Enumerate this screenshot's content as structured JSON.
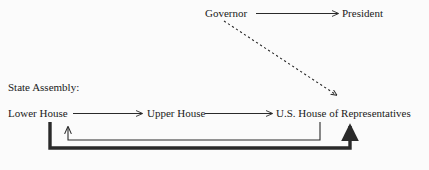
{
  "diagram": {
    "background_color": "#fbfbfb",
    "line_color": "#2a2a2a",
    "text_color": "#1a1a1a",
    "nodes": {
      "governor": "Governor",
      "president": "President",
      "state_assembly": "State Assembly:",
      "lower_house": "Lower House",
      "upper_house": "Upper House",
      "us_house": "U.S. House of Representatives"
    },
    "edges": [
      {
        "id": "governor-to-president",
        "from": "Governor",
        "to": "President",
        "style": "solid",
        "weight": "thin",
        "direction": "right"
      },
      {
        "id": "governor-to-us-house",
        "from": "Governor",
        "to": "U.S. House of Representatives",
        "style": "dashed",
        "weight": "thin",
        "direction": "down-right"
      },
      {
        "id": "lower-house-to-upper-house",
        "from": "Lower House",
        "to": "Upper House",
        "style": "solid",
        "weight": "thin",
        "direction": "right"
      },
      {
        "id": "upper-house-to-us-house",
        "from": "Upper House",
        "to": "U.S. House of Representatives",
        "style": "solid",
        "weight": "thin",
        "direction": "right"
      },
      {
        "id": "inner-feedback-loop",
        "from": "U.S. House of Representatives",
        "to": "Upper House",
        "style": "solid",
        "weight": "thin",
        "direction": "up",
        "shape": "u-turn-below"
      },
      {
        "id": "outer-feedback-loop",
        "from": "Lower House",
        "to": "U.S. House of Representatives",
        "style": "solid",
        "weight": "thick",
        "direction": "up",
        "shape": "u-turn-below"
      }
    ]
  }
}
